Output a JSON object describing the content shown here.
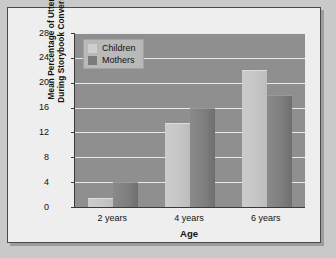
{
  "chart_data": {
    "type": "bar",
    "title": "",
    "xlabel": "Age",
    "ylabel": "Mean Percentage of Utterances During Storybook Conversations",
    "ylabel_line1": "Mean Percentage of Utterances",
    "ylabel_line2": "During Storybook Conversations",
    "categories": [
      "2 years",
      "4 years",
      "6 years"
    ],
    "series": [
      {
        "name": "Children",
        "values": [
          1.5,
          13.6,
          22.0
        ],
        "color": "#c6c6c6"
      },
      {
        "name": "Mothers",
        "values": [
          4.1,
          15.9,
          18.0
        ],
        "color": "#7e7e7e"
      }
    ],
    "ylim": [
      0,
      28
    ],
    "yticks": [
      0,
      4,
      8,
      12,
      16,
      20,
      24,
      28
    ],
    "ytick_labels": [
      "0",
      "4",
      "8",
      "12",
      "16",
      "20",
      "24",
      "28"
    ],
    "grid": true,
    "legend_position": "top-left",
    "legend_entries": [
      "Children",
      "Mothers"
    ],
    "plot_background": "#8f8f8f",
    "gridline_color": "#e8e8e8",
    "figure_background": "#eeeeee",
    "page_background": "#c9c9c9",
    "axis_color": "#3a3a3a"
  }
}
